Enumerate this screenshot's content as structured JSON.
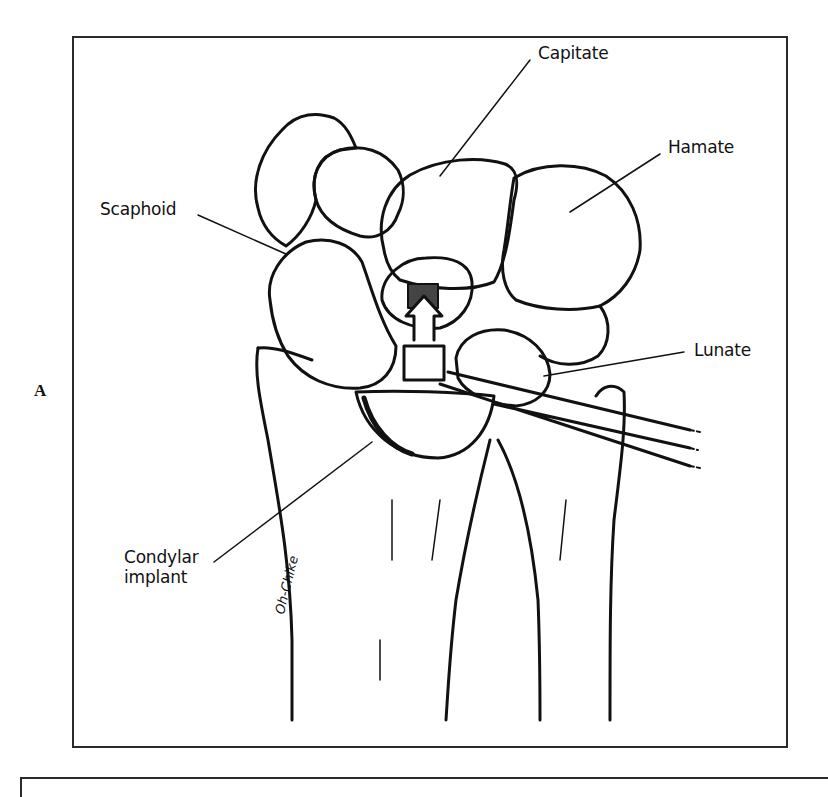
{
  "figure": {
    "panel_letter": "A",
    "signature": "Oh-Chike",
    "labels": {
      "capitate": "Capitate",
      "hamate": "Hamate",
      "scaphoid": "Scaphoid",
      "lunate": "Lunate",
      "condylar_line1": "Condylar",
      "condylar_line2": "implant"
    },
    "colors": {
      "ink": "#111111",
      "background": "#ffffff"
    }
  }
}
